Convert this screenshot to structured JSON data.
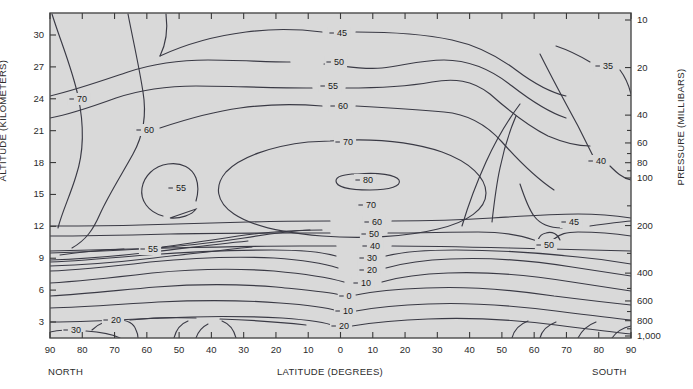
{
  "figure": {
    "background_color": "#ffffff",
    "plot_fill_color": "#d9d9d9",
    "contour_color": "#3a3a45",
    "frame_color": "#4a4a4a"
  },
  "axes": {
    "left": {
      "title": "ALTITUDE (KILOMETERS)",
      "ticks": [
        "30",
        "27",
        "24",
        "21",
        "18",
        "15",
        "12",
        "9",
        "6",
        "3"
      ]
    },
    "right": {
      "title": "PRESSURE (MILLIBARS)",
      "ticks": [
        "10",
        "20",
        "40",
        "60",
        "80",
        "100",
        "200",
        "400",
        "600",
        "800",
        "1,000"
      ]
    },
    "bottom": {
      "title": "LATITUDE (DEGREES)",
      "left_hemisphere": "NORTH",
      "right_hemisphere": "SOUTH",
      "ticks": [
        "90",
        "80",
        "70",
        "60",
        "50",
        "40",
        "30",
        "20",
        "10",
        "0",
        "10",
        "20",
        "30",
        "40",
        "50",
        "60",
        "70",
        "80",
        "90"
      ]
    }
  },
  "chart_data": {
    "type": "contour",
    "title": "",
    "xlabel": "LATITUDE (DEGREES)",
    "ylabel": "ALTITUDE (KILOMETERS)",
    "y2label": "PRESSURE (MILLIBARS)",
    "grid": false,
    "legend": "none",
    "xlim": [
      -90,
      90
    ],
    "ylim": [
      1.5,
      31.5
    ],
    "x_ticks_deg": [
      -90,
      -80,
      -70,
      -60,
      -50,
      -40,
      -30,
      -20,
      -10,
      0,
      10,
      20,
      30,
      40,
      50,
      60,
      70,
      80,
      90
    ],
    "x_tick_labels": [
      "90",
      "80",
      "70",
      "60",
      "50",
      "40",
      "30",
      "20",
      "10",
      "0",
      "10",
      "20",
      "30",
      "40",
      "50",
      "60",
      "70",
      "80",
      "90"
    ],
    "y_ticks_km": [
      3,
      6,
      9,
      12,
      15,
      18,
      21,
      24,
      27,
      30
    ],
    "y2_ticks_mb": [
      10,
      20,
      40,
      60,
      80,
      100,
      200,
      400,
      600,
      800,
      1000
    ],
    "contour_levels": [
      0,
      10,
      20,
      30,
      35,
      40,
      45,
      50,
      55,
      60,
      70,
      80
    ],
    "labeled_contours": [
      {
        "level": "70",
        "x": 79,
        "y": 99
      },
      {
        "level": "60",
        "x": 146,
        "y": 130
      },
      {
        "level": "55",
        "x": 178,
        "y": 188
      },
      {
        "level": "55",
        "x": 150,
        "y": 249
      },
      {
        "level": "45",
        "x": 339,
        "y": 33
      },
      {
        "level": "50",
        "x": 336,
        "y": 62
      },
      {
        "level": "55",
        "x": 330,
        "y": 86
      },
      {
        "level": "60",
        "x": 340,
        "y": 106
      },
      {
        "level": "70",
        "x": 345,
        "y": 142
      },
      {
        "level": "80",
        "x": 365,
        "y": 180
      },
      {
        "level": "70",
        "x": 368,
        "y": 205
      },
      {
        "level": "60",
        "x": 374,
        "y": 222
      },
      {
        "level": "50",
        "x": 371,
        "y": 234
      },
      {
        "level": "40",
        "x": 372,
        "y": 246
      },
      {
        "level": "30",
        "x": 369,
        "y": 258
      },
      {
        "level": "20",
        "x": 369,
        "y": 270
      },
      {
        "level": "10",
        "x": 363,
        "y": 283
      },
      {
        "level": "0",
        "x": 346,
        "y": 296
      },
      {
        "level": "10",
        "x": 345,
        "y": 311
      },
      {
        "level": "20",
        "x": 341,
        "y": 326
      },
      {
        "level": "35",
        "x": 605,
        "y": 66
      },
      {
        "level": "40",
        "x": 598,
        "y": 161
      },
      {
        "level": "45",
        "x": 571,
        "y": 222
      },
      {
        "level": "50",
        "x": 546,
        "y": 245
      },
      {
        "level": "30",
        "x": 73,
        "y": 330
      },
      {
        "level": "20",
        "x": 113,
        "y": 320
      }
    ]
  }
}
